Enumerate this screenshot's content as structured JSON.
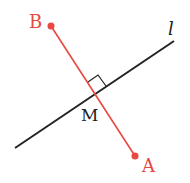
{
  "diagram": {
    "type": "perpendicular-bisector",
    "colors": {
      "segment": "#e8483f",
      "line": "#222222",
      "background": "#ffffff"
    },
    "points": {
      "B": {
        "label": "B",
        "x": 51,
        "y": 26
      },
      "A": {
        "label": "A",
        "x": 135,
        "y": 156
      },
      "M": {
        "label": "M",
        "x": 95,
        "y": 96
      }
    },
    "line": {
      "label": "l",
      "x1": 15,
      "y1": 148,
      "x2": 174,
      "y2": 41
    },
    "right_angle_marker": true
  }
}
